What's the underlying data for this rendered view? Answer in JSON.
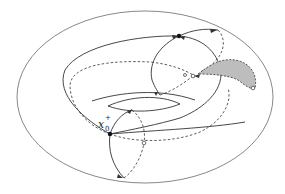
{
  "figure": {
    "point_label": {
      "base": "x",
      "superscript": "+",
      "subscript": "0"
    },
    "colors": {
      "stroke": "#333333",
      "shaded_region": "#bdbdbd",
      "background": "#ffffff"
    }
  }
}
